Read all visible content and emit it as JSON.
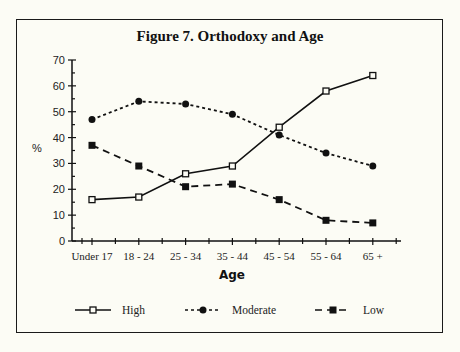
{
  "chart_data": {
    "type": "line",
    "title": "Figure 7. Orthodoxy and Age",
    "xlabel": "Age",
    "ylabel": "%",
    "ylim": [
      0,
      70
    ],
    "yticks": [
      0,
      10,
      20,
      30,
      40,
      50,
      60,
      70
    ],
    "grid": false,
    "legend_position": "bottom",
    "categories": [
      "Under 17",
      "18 - 24",
      "25 - 34",
      "35 - 44",
      "45 - 54",
      "55 - 64",
      "65 +"
    ],
    "series": [
      {
        "name": "High",
        "line_style": "solid",
        "marker": "open-square",
        "values": [
          16,
          17,
          26,
          29,
          44,
          58,
          64
        ]
      },
      {
        "name": "Moderate",
        "line_style": "dotted",
        "marker": "filled-circle",
        "values": [
          47,
          54,
          53,
          49,
          41,
          34,
          29
        ]
      },
      {
        "name": "Low",
        "line_style": "dashed",
        "marker": "filled-square",
        "values": [
          37,
          29,
          21,
          22,
          16,
          8,
          7
        ]
      }
    ]
  },
  "colors": {
    "background": "#fcfcf5",
    "ink": "#111111"
  }
}
